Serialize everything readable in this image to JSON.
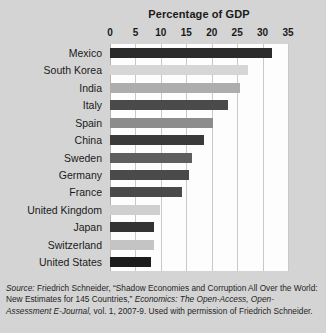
{
  "chart_data": {
    "type": "bar",
    "orientation": "horizontal",
    "title": "Percentage of GDP",
    "xlabel": "",
    "ylabel": "",
    "xlim": [
      0,
      35
    ],
    "xticks": [
      0,
      5,
      10,
      15,
      20,
      25,
      30,
      35
    ],
    "xtick_labels": [
      "0",
      "5",
      "10",
      "15",
      "20",
      "25",
      "30",
      "35"
    ],
    "grid": true,
    "legend": "none",
    "categories": [
      "Mexico",
      "South Korea",
      "India",
      "Italy",
      "Spain",
      "China",
      "Sweden",
      "Germany",
      "France",
      "United Kingdom",
      "Japan",
      "Switzerland",
      "United States"
    ],
    "values": [
      31.8,
      27.2,
      25.6,
      23.2,
      20.2,
      18.4,
      16.2,
      15.6,
      14.2,
      9.8,
      8.6,
      8.6,
      8.0
    ],
    "bar_colors": [
      "#2b2b2b",
      "#d6d6d6",
      "#adadad",
      "#4a4a4a",
      "#8c8c8c",
      "#3a3a3a",
      "#5e5e5e",
      "#4a4a4a",
      "#4a4a4a",
      "#cfcfcf",
      "#333333",
      "#c4c4c4",
      "#1c1c1c"
    ]
  },
  "source_note": {
    "label": "Source:",
    "line1_a": " Friedrich Schneider, “Shadow Economies and Corruption All Over the",
    "line2_a": "World: New Estimates for 145 Countries,” ",
    "line2_it": "Economics: The Open-Access, Open-",
    "line3_it": "Assessment E-Journal,",
    "line3_a": " vol. 1, 2007-9. Used with permission of Friedrich Schneider."
  },
  "colors": {
    "background": "#d4d4d4",
    "plot_background": "#fdfdfd",
    "gridline": "#c9c9c9",
    "text": "#1a1a1a"
  }
}
